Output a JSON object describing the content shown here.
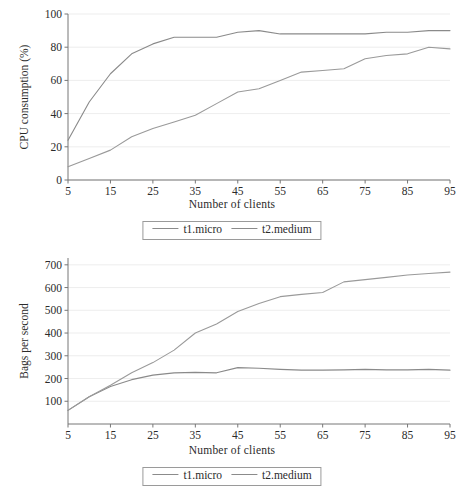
{
  "figures": [
    {
      "id": "cpu",
      "axis_title_x": "Number of clients",
      "legend": {
        "entries": [
          {
            "label": "t1.micro",
            "color": "#8a8a8a"
          },
          {
            "label": "t2.medium",
            "color": "#9a9a9a"
          }
        ]
      }
    },
    {
      "id": "bags",
      "axis_title_x": "Number of clients",
      "legend": {
        "entries": [
          {
            "label": "t1.micro",
            "color": "#8a8a8a"
          },
          {
            "label": "t2.medium",
            "color": "#9a9a9a"
          }
        ]
      }
    }
  ],
  "chart_data": [
    {
      "type": "line",
      "title": "",
      "xlabel": "Number of clients",
      "ylabel": "CPU consumption (%)",
      "xlim": [
        5,
        95
      ],
      "ylim": [
        0,
        100
      ],
      "xticks": [
        5,
        15,
        25,
        35,
        45,
        55,
        65,
        75,
        85,
        95
      ],
      "yticks": [
        0,
        20,
        40,
        60,
        80,
        100
      ],
      "grid": "horizontal",
      "legend_position": "below-axis",
      "x": [
        5,
        10,
        15,
        20,
        25,
        30,
        35,
        40,
        45,
        50,
        55,
        60,
        65,
        70,
        75,
        80,
        85,
        90,
        95
      ],
      "series": [
        {
          "name": "t1.micro",
          "color": "#8a8a8a",
          "values": [
            24,
            47,
            64,
            76,
            82,
            86,
            86,
            86,
            89,
            90,
            88,
            88,
            88,
            88,
            88,
            89,
            89,
            90,
            90
          ]
        },
        {
          "name": "t2.medium",
          "color": "#9a9a9a",
          "values": [
            8,
            13,
            18,
            26,
            31,
            35,
            39,
            46,
            53,
            55,
            60,
            65,
            66,
            67,
            73,
            75,
            76,
            80,
            79
          ]
        }
      ]
    },
    {
      "type": "line",
      "title": "",
      "xlabel": "Number of clients",
      "ylabel": "Bags per second",
      "xlim": [
        5,
        95
      ],
      "ylim": [
        0,
        730
      ],
      "xticks": [
        5,
        15,
        25,
        35,
        45,
        55,
        65,
        75,
        85,
        95
      ],
      "yticks": [
        100,
        200,
        300,
        400,
        500,
        600,
        700
      ],
      "grid": "horizontal",
      "legend_position": "below-axis",
      "x": [
        5,
        10,
        15,
        20,
        25,
        30,
        35,
        40,
        45,
        50,
        55,
        60,
        65,
        70,
        75,
        80,
        85,
        90,
        95
      ],
      "series": [
        {
          "name": "t1.micro",
          "color": "#8a8a8a",
          "values": [
            60,
            120,
            165,
            195,
            215,
            225,
            227,
            225,
            248,
            245,
            240,
            237,
            237,
            238,
            240,
            238,
            238,
            240,
            237
          ]
        },
        {
          "name": "t2.medium",
          "color": "#9a9a9a",
          "values": [
            60,
            120,
            170,
            225,
            270,
            325,
            400,
            440,
            495,
            530,
            560,
            570,
            578,
            625,
            635,
            645,
            655,
            662,
            668
          ]
        }
      ]
    }
  ]
}
